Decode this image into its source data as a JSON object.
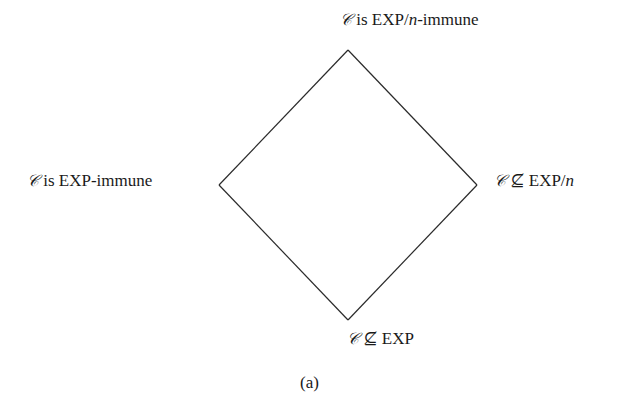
{
  "diagram": {
    "nodes": {
      "top": {
        "symbol": "𝒞",
        "rel": " is EXP/",
        "var": "n",
        "suffix": "-immune"
      },
      "left": {
        "symbol": "𝒞",
        "text": " is EXP-immune"
      },
      "right": {
        "symbol": "𝒞",
        "rel": " ⊈ EXP/",
        "var": "n"
      },
      "bottom": {
        "symbol": "𝒞",
        "text": " ⊈ EXP"
      }
    },
    "edges": [
      {
        "from": "top",
        "to": "left"
      },
      {
        "from": "top",
        "to": "right"
      },
      {
        "from": "left",
        "to": "bottom"
      },
      {
        "from": "right",
        "to": "bottom"
      }
    ],
    "caption": "(a)",
    "line_color": "#2a2a2a"
  }
}
